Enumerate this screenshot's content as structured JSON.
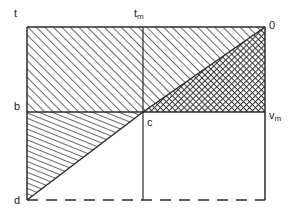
{
  "figure": {
    "title": "",
    "type": "geometric-diagram",
    "background": "#ffffff",
    "line_color": "#2b2b2b",
    "hatch_color": "#444444",
    "labels": {
      "top_left": "t",
      "top_middle_base": "t",
      "top_middle_sub": "m",
      "top_right": "0",
      "mid_left": "b",
      "mid_center": "c",
      "mid_right_base": "v",
      "mid_right_sub": "m",
      "bottom_left": "d"
    },
    "geometry": {
      "x_left": 27,
      "x_mid": 143,
      "x_right": 265,
      "y_top": 27,
      "y_mid": 112,
      "y_bottom": 200
    },
    "regions": [
      {
        "name": "upper-left-rect",
        "fill": "diagonal-hatch-45"
      },
      {
        "name": "upper-right-upper-triangle",
        "fill": "diagonal-hatch-45"
      },
      {
        "name": "upper-right-lower-triangle",
        "fill": "cross-hatch"
      },
      {
        "name": "lower-left-triangle",
        "fill": "steep-hatch"
      },
      {
        "name": "lower-right-rect",
        "fill": "none"
      }
    ],
    "edges": [
      {
        "name": "top-edge",
        "style": "solid"
      },
      {
        "name": "left-edge",
        "style": "solid"
      },
      {
        "name": "right-edge",
        "style": "solid"
      },
      {
        "name": "mid-horizontal",
        "style": "solid"
      },
      {
        "name": "mid-vertical",
        "style": "solid"
      },
      {
        "name": "diagonal-c-to-0",
        "style": "solid"
      },
      {
        "name": "diagonal-d-to-c",
        "style": "solid"
      },
      {
        "name": "bottom-edge",
        "style": "dashed"
      }
    ]
  }
}
